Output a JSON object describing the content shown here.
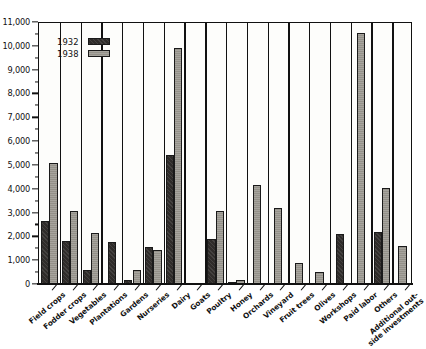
{
  "chart_data": {
    "type": "bar",
    "title": "",
    "xlabel": "",
    "ylabel": "",
    "ylim": [
      0,
      11000
    ],
    "ytick_step": 1000,
    "yminor_step": 500,
    "grid": false,
    "legend_position": "top-left",
    "categories": [
      "Field crops",
      "Fodder crops",
      "Vegetables",
      "Plantations",
      "Gardens",
      "Nurseries",
      "Dairy",
      "Goats",
      "Poultry",
      "Honey",
      "Orchards",
      "Vineyard",
      "Fruit trees",
      "Olives",
      "Workshops",
      "Paid labor",
      "Others",
      "Additional out-\nside investments"
    ],
    "ytick_labels": [
      "11,000",
      "10,000",
      "9,000",
      "8,000",
      "7,000",
      "6,000",
      "5,000",
      "4,000",
      "3,000",
      "2,000",
      "1,000",
      "0"
    ],
    "series": [
      {
        "name": "1932",
        "color": "#2f2c2a",
        "values": [
          2650,
          1800,
          600,
          1750,
          180,
          1550,
          5400,
          0,
          1900,
          50,
          0,
          0,
          0,
          0,
          2100,
          0,
          2200,
          0
        ]
      },
      {
        "name": "1938",
        "color": "#949189",
        "values": [
          5100,
          3050,
          2150,
          0,
          580,
          1430,
          9900,
          0,
          3050,
          170,
          4150,
          3200,
          900,
          500,
          0,
          10550,
          4050,
          1600
        ]
      }
    ]
  },
  "legend": {
    "items": [
      {
        "label": "1932",
        "swatch": "dark-hatched-swatch"
      },
      {
        "label": "1938",
        "swatch": "gray-hatched-swatch"
      }
    ]
  }
}
